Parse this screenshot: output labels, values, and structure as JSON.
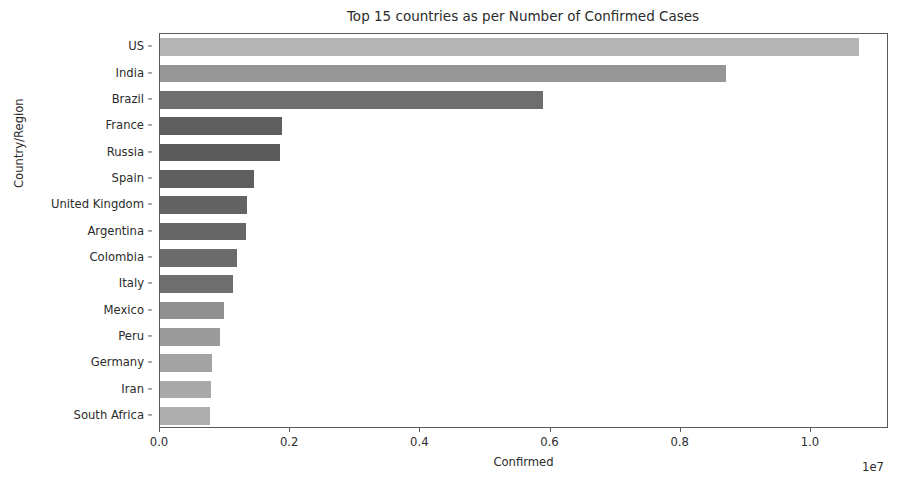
{
  "chart_data": {
    "type": "bar",
    "orientation": "horizontal",
    "title": "Top 15 countries as per Number of Confirmed Cases",
    "xlabel": "Confirmed",
    "ylabel": "Country/Region",
    "x_exponent_label": "1e7",
    "xlim": [
      0,
      11200000
    ],
    "xticks": [
      0,
      2000000,
      4000000,
      6000000,
      8000000,
      10000000
    ],
    "xtick_labels": [
      "0.0",
      "0.2",
      "0.4",
      "0.6",
      "0.8",
      "1.0"
    ],
    "grid": false,
    "legend": "none",
    "categories": [
      "US",
      "India",
      "Brazil",
      "France",
      "Russia",
      "Spain",
      "United Kingdom",
      "Argentina",
      "Colombia",
      "Italy",
      "Mexico",
      "Peru",
      "Germany",
      "Iran",
      "South Africa"
    ],
    "values": [
      10740000,
      8690000,
      5880000,
      1880000,
      1850000,
      1450000,
      1340000,
      1320000,
      1180000,
      1120000,
      980000,
      920000,
      800000,
      780000,
      770000
    ],
    "bar_colors": [
      "#b4b4b4",
      "#969696",
      "#6e6e6e",
      "#5e5e5e",
      "#5c5c5c",
      "#5f5f5f",
      "#636363",
      "#666666",
      "#6b6b6b",
      "#6f6f6f",
      "#8f8f8f",
      "#9b9b9b",
      "#a3a3a3",
      "#a9a9a9",
      "#adadad"
    ]
  },
  "style": {
    "background": "#ffffff",
    "axis_color": "#5a5a5a",
    "text_color": "#2b2b2b"
  }
}
